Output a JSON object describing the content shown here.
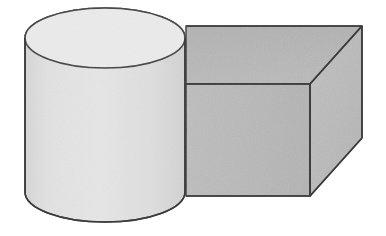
{
  "figure": {
    "title": "Two geometric solids: cylinder and rectangular box",
    "background_color": "#ffffff",
    "canvas": {
      "width": 386,
      "height": 236
    },
    "text_labels": [],
    "objects": [
      {
        "name": "cylinder",
        "description": "Upright circular cylinder, front-left, light gray, drawn in oblique/perspective view with visible elliptical top",
        "fill_body": "#e1e1e1",
        "fill_top": "#eaeaea",
        "stroke": "#3c3c3c",
        "stroke_width": 1.6,
        "geometry": {
          "center_x": 105,
          "top_ellipse_center_y": 38,
          "bottom_ellipse_center_y": 192,
          "radius_x": 80,
          "radius_y": 30,
          "left_edge_x": 25,
          "right_edge_x": 185,
          "top_apex_y": 8,
          "bottom_apex_y": 222
        }
      },
      {
        "name": "rectangular-box",
        "description": "Rectangular cuboid (box) behind and right of the cylinder, medium gray, showing front face, top face and right face",
        "fill_front": "#b9b9b9",
        "fill_top": "#b4b4b4",
        "fill_right": "#bcbcbc",
        "stroke": "#3c3c3c",
        "stroke_width": 1.6,
        "geometry": {
          "front_face": [
            [
              186,
              84
            ],
            [
              310,
              84
            ],
            [
              310,
              196
            ],
            [
              186,
              196
            ]
          ],
          "top_face": [
            [
              186,
              26
            ],
            [
              362,
              26
            ],
            [
              310,
              84
            ],
            [
              186,
              84
            ]
          ],
          "right_face": [
            [
              310,
              84
            ],
            [
              362,
              26
            ],
            [
              362,
              138
            ],
            [
              310,
              196
            ]
          ],
          "near_vertical_corner_x": 310,
          "far_right_edge_x": 362,
          "top_edge_y": 26,
          "mid_edge_y": 84,
          "bottom_edge_y": 196
        }
      }
    ],
    "colors": {
      "cylinder_light": "#e1e1e1",
      "cylinder_top": "#eaeaea",
      "box_gray": "#b9b9b9",
      "outline": "#3c3c3c",
      "paper_white": "#ffffff"
    }
  }
}
